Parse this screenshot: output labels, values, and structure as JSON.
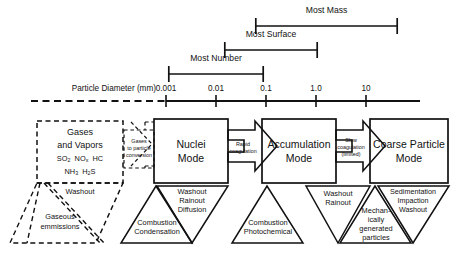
{
  "figure": {
    "axis": {
      "name": "Particle Diameter (mm)",
      "ticks": [
        "0.001",
        "0.01",
        "0.1",
        "1.0",
        "10"
      ],
      "tick_x": [
        166,
        216,
        266,
        316,
        366
      ],
      "line_solid_from": 166,
      "line_solid_to": 420,
      "dashed_from": 30,
      "dashed_to": 166
    },
    "brackets": [
      {
        "label": "Most Number",
        "x1": 168,
        "x2": 264,
        "y": 74,
        "label_y": 60
      },
      {
        "label": "Most Surface",
        "x1": 224,
        "x2": 318,
        "y": 50,
        "label_y": 36
      },
      {
        "label": "Most Mass",
        "x1": 255,
        "x2": 398,
        "y": 26,
        "label_y": 12
      }
    ],
    "modes": [
      {
        "name": "gases-and-vapors",
        "line1": "Gases",
        "line2": "and Vapors",
        "species_line1": [
          "SO",
          "2",
          " NO",
          "x",
          "  HC"
        ],
        "species_text1": "SO2  NOx  HC",
        "species_text2": "NH3  H2S",
        "style": "dashed"
      },
      {
        "name": "nuclei-mode",
        "line1": "Nuclei",
        "line2": "Mode",
        "style": "solid"
      },
      {
        "name": "accumulation-mode",
        "line1": "Accumulation",
        "line2": "Mode",
        "style": "solid"
      },
      {
        "name": "coarse-particle-mode",
        "line1": "Coarse Particle",
        "line2": "Mode",
        "style": "solid"
      }
    ],
    "conversion_box": {
      "name": "gases-to-particle-conversion",
      "line1": "Gases",
      "line2": "to particle",
      "line3": "conversion"
    },
    "arrows": [
      {
        "name": "rapid-coagulation-arrow",
        "line1": "Rapid",
        "line2": "coagulation"
      },
      {
        "name": "slow-coagulation-arrow",
        "line1": "Slow",
        "line2": "coagulation",
        "line3": "(limited)"
      }
    ],
    "washout_parallelogram": {
      "name": "washout-gaseous-emissions",
      "top_label": "Washout",
      "line1": "Gaseous",
      "line2": "emmissions"
    },
    "removal_triangles": [
      {
        "name": "nuclei-removal-triangle",
        "lines": [
          "Washout",
          "Rainout",
          "Diffusion"
        ]
      },
      {
        "name": "accumulation-removal-triangle",
        "lines": [
          "Washout",
          "Rainout"
        ]
      },
      {
        "name": "coarse-removal-triangle",
        "lines": [
          "Sedimentation",
          "Impaction",
          "Washout"
        ]
      }
    ],
    "source_triangles": [
      {
        "name": "nuclei-source-triangle",
        "lines": [
          "Combustion",
          "Condensation"
        ]
      },
      {
        "name": "accumulation-source-triangle",
        "lines": [
          "Combustion",
          "Photochemical"
        ]
      },
      {
        "name": "coarse-source-triangle",
        "lines": [
          "Mechan-",
          "ically",
          "generated",
          "particles"
        ]
      }
    ],
    "colors": {
      "stroke": "#111111",
      "text": "#121212",
      "background": "#ffffff"
    }
  }
}
